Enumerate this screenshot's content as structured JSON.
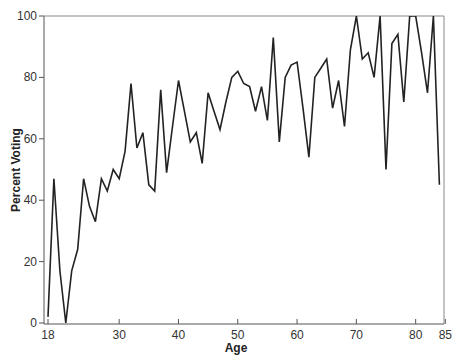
{
  "chart_data": {
    "type": "line",
    "title": "",
    "xlabel": "Age",
    "ylabel": "Percent Voting",
    "xlim": [
      18,
      85
    ],
    "ylim": [
      0,
      100
    ],
    "grid": false,
    "legend": null,
    "x_ticks": [
      18,
      30,
      40,
      50,
      60,
      70,
      80,
      85
    ],
    "y_ticks": [
      0,
      20,
      40,
      60,
      80,
      100
    ],
    "series": [
      {
        "name": "Percent Voting",
        "color": "#222222",
        "x": [
          18,
          19,
          20,
          21,
          22,
          23,
          24,
          25,
          26,
          27,
          28,
          29,
          30,
          31,
          32,
          33,
          34,
          35,
          36,
          37,
          38,
          39,
          40,
          41,
          42,
          43,
          44,
          45,
          46,
          47,
          48,
          49,
          50,
          51,
          52,
          53,
          54,
          55,
          56,
          57,
          58,
          59,
          60,
          61,
          62,
          63,
          64,
          65,
          66,
          67,
          68,
          69,
          70,
          71,
          72,
          73,
          74,
          75,
          76,
          77,
          78,
          79,
          80,
          81,
          82,
          83,
          84
        ],
        "values": [
          2,
          47,
          17,
          0,
          17,
          24,
          47,
          38,
          33,
          47,
          43,
          50,
          47,
          56,
          78,
          57,
          62,
          45,
          43,
          76,
          49,
          64,
          79,
          69,
          59,
          62,
          52,
          75,
          69,
          63,
          72,
          80,
          82,
          78,
          77,
          69,
          77,
          66,
          93,
          59,
          80,
          84,
          85,
          70,
          54,
          80,
          83,
          86,
          70,
          79,
          64,
          89,
          100,
          86,
          88,
          80,
          100,
          50,
          91,
          94,
          72,
          100,
          100,
          88,
          75,
          100,
          45
        ]
      }
    ]
  }
}
